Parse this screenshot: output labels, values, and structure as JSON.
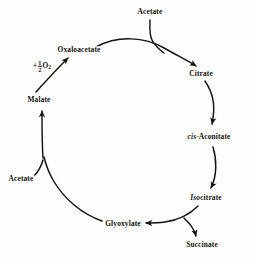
{
  "diagram": {
    "background_color": "#fefefe",
    "stroke_color": "#15130f",
    "nodes": [
      {
        "id": "acetate_top",
        "label": "Acetate",
        "x": 150,
        "y": 12
      },
      {
        "id": "oxaloacetate",
        "label": "Oxaloacetate",
        "x": 79,
        "y": 50
      },
      {
        "id": "citrate",
        "label": "Citrate",
        "x": 201,
        "y": 74
      },
      {
        "id": "cis_aconitate",
        "label": "cis-Aconitate",
        "italic_prefix": "cis-",
        "plain_suffix": "Aconitate",
        "x": 209,
        "y": 137
      },
      {
        "id": "isocitrate",
        "label": "Isocitrate",
        "italic_prefix": "Iso",
        "plain_suffix": "citrate",
        "x": 206,
        "y": 198
      },
      {
        "id": "succinate",
        "label": "Succinate",
        "x": 202,
        "y": 245
      },
      {
        "id": "glyoxylate",
        "label": "Glyoxylate",
        "x": 123,
        "y": 224
      },
      {
        "id": "acetate_left",
        "label": "Acetate",
        "x": 21,
        "y": 179
      },
      {
        "id": "malate",
        "label": "Malate",
        "x": 39,
        "y": 100
      }
    ],
    "annotation": {
      "id": "oxygen_term",
      "plus": "+",
      "numerator": "1",
      "denominator": "2",
      "species": "O",
      "subscript": "2",
      "full_text": "+ 1/2 O2",
      "x": 42,
      "y": 66
    }
  }
}
